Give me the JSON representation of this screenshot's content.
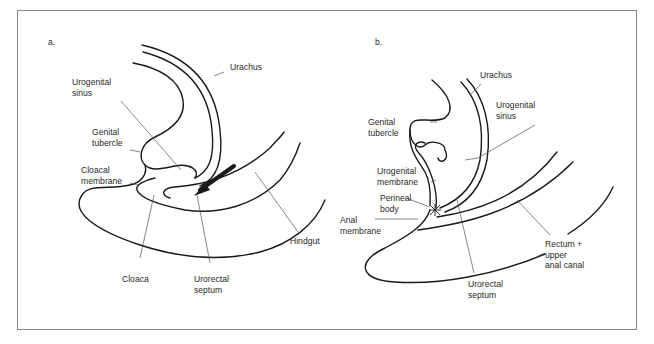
{
  "figure": {
    "panels": [
      {
        "id": "a",
        "letter": "a.",
        "labels": {
          "urachus": "Urachus",
          "urogenital_sinus": "Urogenital\nsinus",
          "genital_tubercle": "Genital\ntubercle",
          "cloacal_membrane": "Cloacal\nmembrane",
          "cloaca": "Cloaca",
          "urorectal_septum": "Urorectal\nseptum",
          "hindgut": "Hindgut"
        }
      },
      {
        "id": "b",
        "letter": "b.",
        "labels": {
          "urachus": "Urachus",
          "urogenital_sinus": "Urogenital\nsinus",
          "genital_tubercle": "Genital\ntubercle",
          "urogenital_membrane": "Urogenital\nmembrane",
          "perineal_body": "Perineal\nbody",
          "anal_membrane": "Anal\nmembrane",
          "urorectal_septum": "Urorectal\nseptum",
          "rectum_upper_anal_canal": "Rectum +\nupper\nanal canal"
        }
      }
    ],
    "colors": {
      "line": "#1a1a1a",
      "leader": "#555555",
      "frame": "#8a8a8a",
      "text": "#2a2a2a"
    }
  }
}
